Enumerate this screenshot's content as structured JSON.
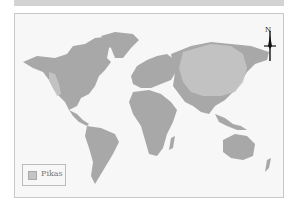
{
  "map": {
    "type": "world-distribution-map",
    "subject": "Pikas",
    "colors": {
      "background": "#f7f7f7",
      "land": "#a8a8a8",
      "range": "#c4c4c4",
      "frame": "#c8c8c8",
      "banner": "#d3d3d3"
    },
    "north_arrow": {
      "label": "N"
    },
    "legend": {
      "items": [
        {
          "label": "Pikas",
          "color": "#c4c4c4"
        }
      ]
    },
    "ranges": [
      {
        "name": "Central & East Asia",
        "shape": "large rounded region covering central Asia, Mongolia, northern China, Siberia"
      },
      {
        "name": "Western North America",
        "shape": "narrow band along Rocky Mountains"
      }
    ]
  }
}
